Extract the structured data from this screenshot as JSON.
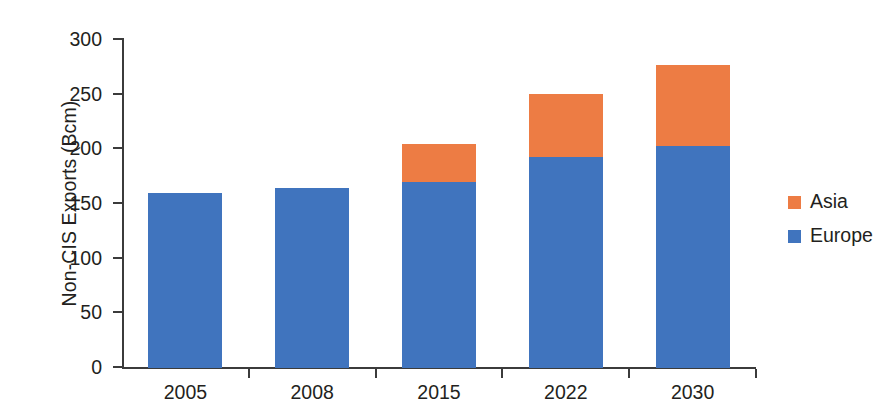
{
  "chart_data": {
    "type": "bar",
    "subtype": "stacked-vertical",
    "title": "",
    "xlabel": "",
    "ylabel": "Non-CIS Exports (Bcm)",
    "categories": [
      "2005",
      "2008",
      "2015",
      "2022",
      "2030"
    ],
    "series": [
      {
        "name": "Europe",
        "color": "#4074be",
        "values": [
          160,
          165,
          170,
          193,
          203
        ]
      },
      {
        "name": "Asia",
        "color": "#ed7c44",
        "values": [
          0,
          0,
          35,
          58,
          74
        ]
      }
    ],
    "totals": [
      160,
      165,
      205,
      251,
      277
    ],
    "ylim": [
      0,
      300
    ],
    "yticks": [
      0,
      50,
      100,
      150,
      200,
      250,
      300
    ],
    "ytick_labels": [
      "0",
      "50",
      "100",
      "150",
      "200",
      "250",
      "300"
    ],
    "grid": false,
    "legend_position": "right",
    "legend": [
      {
        "label": "Asia",
        "color": "#ed7c44"
      },
      {
        "label": "Europe",
        "color": "#4074be"
      }
    ],
    "stack_order_bottom_to_top": [
      "Europe",
      "Asia"
    ],
    "background_color": "#ffffff",
    "axis_color": "#3b3b3b",
    "text_color": "#231f20"
  }
}
